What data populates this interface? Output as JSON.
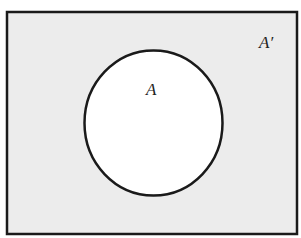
{
  "diagram": {
    "type": "venn",
    "universe": {
      "label": "A′",
      "fill": "#ececec",
      "stroke": "#1a1a1a"
    },
    "sets": [
      {
        "label": "A",
        "fill": "#ffffff",
        "stroke": "#1a1a1a"
      }
    ]
  }
}
